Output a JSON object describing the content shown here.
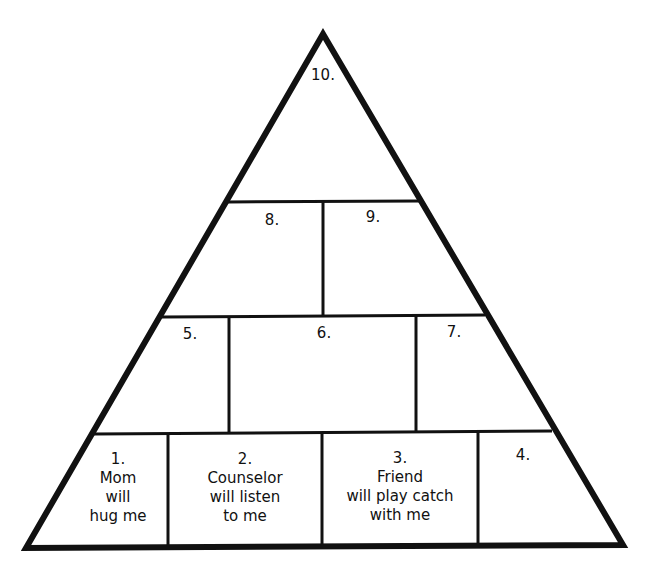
{
  "pyramid": {
    "blocks": [
      {
        "number": "1.",
        "text": [
          "Mom",
          "will",
          "hug me"
        ]
      },
      {
        "number": "2.",
        "text": [
          "Counselor",
          "will listen",
          "to me"
        ]
      },
      {
        "number": "3.",
        "text": [
          "Friend",
          "will play catch",
          "with me"
        ]
      },
      {
        "number": "4.",
        "text": []
      },
      {
        "number": "5.",
        "text": []
      },
      {
        "number": "6.",
        "text": []
      },
      {
        "number": "7.",
        "text": []
      },
      {
        "number": "8.",
        "text": []
      },
      {
        "number": "9.",
        "text": []
      },
      {
        "number": "10.",
        "text": []
      }
    ],
    "colors": {
      "line": "#111111",
      "background": "#ffffff"
    }
  }
}
